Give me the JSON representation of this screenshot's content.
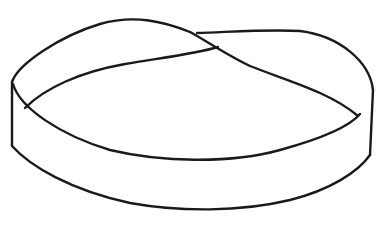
{
  "figure": {
    "background_color": "#ffffff",
    "stroke_color": "#1a1a1a",
    "stroke_width": 2.4
  }
}
